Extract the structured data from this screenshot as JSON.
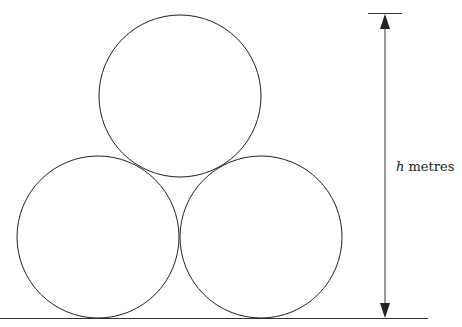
{
  "diagram": {
    "label": {
      "variable": "h",
      "unit": " metres"
    },
    "circles": [
      {
        "name": "bottom-left",
        "cx": 98,
        "cy": 237,
        "r": 81
      },
      {
        "name": "bottom-right",
        "cx": 261,
        "cy": 237,
        "r": 81
      },
      {
        "name": "top",
        "cx": 180,
        "cy": 96,
        "r": 81
      }
    ],
    "colors": {
      "stroke": "#222222",
      "background": "#ffffff"
    }
  }
}
